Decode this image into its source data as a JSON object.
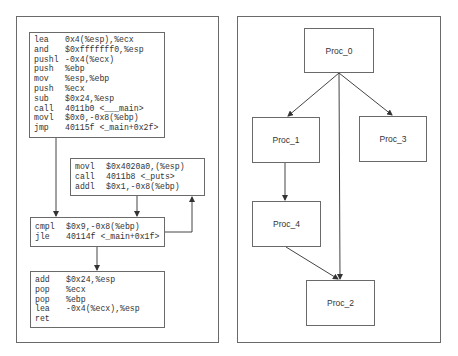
{
  "left_panel": {
    "blocks": [
      {
        "id": "block-entry",
        "lines": [
          {
            "op": "lea",
            "args": "0x4(%esp),%ecx"
          },
          {
            "op": "and",
            "args": "$0xfffffff0,%esp"
          },
          {
            "op": "pushl",
            "args": "-0x4(%ecx)"
          },
          {
            "op": "push",
            "args": "%ebp"
          },
          {
            "op": "mov",
            "args": "%esp,%ebp"
          },
          {
            "op": "push",
            "args": "%ecx"
          },
          {
            "op": "sub",
            "args": "$0x24,%esp"
          },
          {
            "op": "call",
            "args": "4011b0 <___main>"
          },
          {
            "op": "movl",
            "args": "$0x0,-0x8(%ebp)"
          },
          {
            "op": "jmp",
            "args": "40115f <_main+0x2f>"
          }
        ]
      },
      {
        "id": "block-loop-body",
        "lines": [
          {
            "op": "movl",
            "args": "$0x4020a0,(%esp)"
          },
          {
            "op": "call",
            "args": "4011b8 <_puts>"
          },
          {
            "op": "addl",
            "args": "$0x1,-0x8(%ebp)"
          }
        ]
      },
      {
        "id": "block-loop-cond",
        "lines": [
          {
            "op": "cmpl",
            "args": "$0x9,-0x8(%ebp)"
          },
          {
            "op": "jle",
            "args": "40114f <_main+0x1f>"
          }
        ]
      },
      {
        "id": "block-exit",
        "lines": [
          {
            "op": "add",
            "args": "$0x24,%esp"
          },
          {
            "op": "pop",
            "args": "%ecx"
          },
          {
            "op": "pop",
            "args": "%ebp"
          },
          {
            "op": "lea",
            "args": "-0x4(%ecx),%esp"
          },
          {
            "op": "ret",
            "args": ""
          }
        ]
      }
    ]
  },
  "right_panel": {
    "nodes": [
      {
        "id": "proc0",
        "label": "Proc_0"
      },
      {
        "id": "proc1",
        "label": "Proc_1"
      },
      {
        "id": "proc3",
        "label": "Proc_3"
      },
      {
        "id": "proc4",
        "label": "Proc_4"
      },
      {
        "id": "proc2",
        "label": "Proc_2"
      }
    ],
    "edges": [
      {
        "from": "Proc_0",
        "to": "Proc_1"
      },
      {
        "from": "Proc_0",
        "to": "Proc_3"
      },
      {
        "from": "Proc_0",
        "to": "Proc_2"
      },
      {
        "from": "Proc_1",
        "to": "Proc_4"
      },
      {
        "from": "Proc_4",
        "to": "Proc_2"
      }
    ]
  },
  "colors": {
    "border": "#6a6a6a",
    "text": "#333333",
    "edge": "#444444"
  }
}
